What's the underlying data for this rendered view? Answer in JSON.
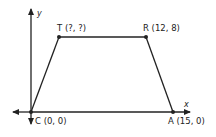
{
  "diagram": {
    "type": "coordinate-geometry",
    "shape": "trapezoid",
    "axes": {
      "x_label": "x",
      "y_label": "y"
    },
    "points": [
      {
        "name": "T",
        "label": "T (?, ?)",
        "coords": [
          "?",
          "?"
        ]
      },
      {
        "name": "R",
        "label": "R (12, 8)",
        "coords": [
          12,
          8
        ]
      },
      {
        "name": "C",
        "label": "C (0, 0)",
        "coords": [
          0,
          0
        ]
      },
      {
        "name": "A",
        "label": "A (15, 0)",
        "coords": [
          15,
          0
        ]
      }
    ],
    "colors": {
      "line": "#222222",
      "background": "#ffffff"
    }
  }
}
